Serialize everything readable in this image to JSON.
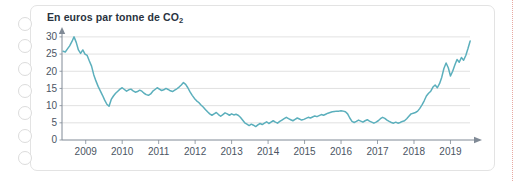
{
  "figure": {
    "title_main": "En euros par tonne de CO",
    "title_sub": "2",
    "binding_hole_count": 7,
    "binding_hole_name": "binding-hole",
    "crop_rule_name": "crop-rule",
    "line_color": "#5BAFBC",
    "gridline_color": "#d9d9d9",
    "axis_color": "#808a96",
    "border_color": "#e3e3e3",
    "crop_rule_color": "#e8a9a2",
    "title_color": "#2a3340",
    "tick_label_color": "#4b5563"
  },
  "chart_data": {
    "type": "line",
    "title": "En euros par tonne de CO2",
    "xlabel": "",
    "ylabel": "",
    "unit": "euros par tonne de CO2",
    "grid": true,
    "legend": false,
    "ylim": [
      0,
      32
    ],
    "yticks": [
      0,
      5,
      10,
      15,
      20,
      25,
      30
    ],
    "ytick_labels": [
      "0",
      "5",
      "10",
      "15",
      "20",
      "25",
      "30"
    ],
    "xlim": [
      2008.35,
      2019.7
    ],
    "xticks": [
      2009,
      2010,
      2011,
      2012,
      2013,
      2014,
      2015,
      2016,
      2017,
      2018,
      2019
    ],
    "xtick_labels": [
      "2009",
      "2010",
      "2011",
      "2012",
      "2013",
      "2014",
      "2015",
      "2016",
      "2017",
      "2018",
      "2019"
    ],
    "series": [
      {
        "name": "Prix du quota carbone",
        "color": "#5BAFBC",
        "x": [
          2008.38,
          2008.44,
          2008.5,
          2008.56,
          2008.62,
          2008.68,
          2008.74,
          2008.8,
          2008.86,
          2008.92,
          2008.98,
          2009.04,
          2009.1,
          2009.16,
          2009.22,
          2009.28,
          2009.34,
          2009.4,
          2009.46,
          2009.52,
          2009.58,
          2009.64,
          2009.7,
          2009.76,
          2009.82,
          2009.88,
          2009.94,
          2010.0,
          2010.06,
          2010.12,
          2010.18,
          2010.24,
          2010.3,
          2010.36,
          2010.42,
          2010.48,
          2010.54,
          2010.6,
          2010.66,
          2010.72,
          2010.78,
          2010.84,
          2010.9,
          2010.96,
          2011.02,
          2011.08,
          2011.14,
          2011.2,
          2011.26,
          2011.32,
          2011.38,
          2011.44,
          2011.5,
          2011.56,
          2011.62,
          2011.68,
          2011.74,
          2011.8,
          2011.86,
          2011.92,
          2011.98,
          2012.04,
          2012.1,
          2012.16,
          2012.22,
          2012.28,
          2012.34,
          2012.4,
          2012.46,
          2012.52,
          2012.58,
          2012.64,
          2012.7,
          2012.76,
          2012.82,
          2012.88,
          2012.94,
          2013.0,
          2013.06,
          2013.12,
          2013.18,
          2013.24,
          2013.3,
          2013.36,
          2013.42,
          2013.48,
          2013.54,
          2013.6,
          2013.66,
          2013.72,
          2013.78,
          2013.84,
          2013.9,
          2013.96,
          2014.02,
          2014.08,
          2014.14,
          2014.2,
          2014.26,
          2014.32,
          2014.38,
          2014.44,
          2014.5,
          2014.56,
          2014.62,
          2014.68,
          2014.74,
          2014.8,
          2014.86,
          2014.92,
          2014.98,
          2015.04,
          2015.1,
          2015.16,
          2015.22,
          2015.28,
          2015.34,
          2015.4,
          2015.46,
          2015.52,
          2015.58,
          2015.64,
          2015.7,
          2015.76,
          2015.82,
          2015.88,
          2015.94,
          2016.0,
          2016.06,
          2016.12,
          2016.18,
          2016.24,
          2016.3,
          2016.36,
          2016.42,
          2016.48,
          2016.54,
          2016.6,
          2016.66,
          2016.72,
          2016.78,
          2016.84,
          2016.9,
          2016.96,
          2017.02,
          2017.08,
          2017.14,
          2017.2,
          2017.26,
          2017.32,
          2017.38,
          2017.44,
          2017.5,
          2017.56,
          2017.62,
          2017.68,
          2017.74,
          2017.8,
          2017.86,
          2017.92,
          2017.98,
          2018.04,
          2018.1,
          2018.16,
          2018.22,
          2018.28,
          2018.34,
          2018.4,
          2018.46,
          2018.52,
          2018.58,
          2018.64,
          2018.7,
          2018.76,
          2018.82,
          2018.88,
          2018.94,
          2019.0,
          2019.06,
          2019.12,
          2019.18,
          2019.24,
          2019.3,
          2019.36,
          2019.42,
          2019.48,
          2019.54
        ],
        "y": [
          25.8,
          25.6,
          26.5,
          27.4,
          28.6,
          30.0,
          28.4,
          26.2,
          25.2,
          26.2,
          25.0,
          24.6,
          23.0,
          21.5,
          19.0,
          17.2,
          15.6,
          14.3,
          13.0,
          11.6,
          10.4,
          9.8,
          11.8,
          12.8,
          13.6,
          14.2,
          14.8,
          15.2,
          14.7,
          14.2,
          14.6,
          14.8,
          14.3,
          13.9,
          14.1,
          14.5,
          14.2,
          13.6,
          13.2,
          13.0,
          13.4,
          14.2,
          14.7,
          15.2,
          14.8,
          14.4,
          14.6,
          15.0,
          14.7,
          14.3,
          14.1,
          14.5,
          14.9,
          15.4,
          16.0,
          16.7,
          16.2,
          15.2,
          14.0,
          13.0,
          12.1,
          11.4,
          10.9,
          10.2,
          9.6,
          8.9,
          8.2,
          7.6,
          7.2,
          7.6,
          8.0,
          7.4,
          6.9,
          7.4,
          7.9,
          7.6,
          7.2,
          7.6,
          7.3,
          7.5,
          7.2,
          6.6,
          5.8,
          5.0,
          4.6,
          4.2,
          4.6,
          4.3,
          3.9,
          4.4,
          4.8,
          4.5,
          4.9,
          5.3,
          4.8,
          5.2,
          5.6,
          5.2,
          4.9,
          5.4,
          5.8,
          6.2,
          6.6,
          6.2,
          5.9,
          5.6,
          6.0,
          6.4,
          6.1,
          5.8,
          6.0,
          6.3,
          6.6,
          6.4,
          6.7,
          7.0,
          6.8,
          7.1,
          7.4,
          7.2,
          7.5,
          7.8,
          8.0,
          8.2,
          8.3,
          8.4,
          8.4,
          8.5,
          8.4,
          8.2,
          7.6,
          6.4,
          5.4,
          5.1,
          5.4,
          5.8,
          5.5,
          5.2,
          5.6,
          5.9,
          5.5,
          5.2,
          4.9,
          5.2,
          5.6,
          6.2,
          6.6,
          6.3,
          5.8,
          5.4,
          5.1,
          4.9,
          5.2,
          4.9,
          5.1,
          5.4,
          5.6,
          6.2,
          6.9,
          7.6,
          7.8,
          8.0,
          8.4,
          9.2,
          10.2,
          11.4,
          12.8,
          13.6,
          14.2,
          15.4,
          16.0,
          15.2,
          16.4,
          18.2,
          20.8,
          22.4,
          21.0,
          18.6,
          20.0,
          21.8,
          23.4,
          22.6,
          24.0,
          23.2,
          24.6,
          26.6,
          28.8
        ]
      }
    ]
  }
}
